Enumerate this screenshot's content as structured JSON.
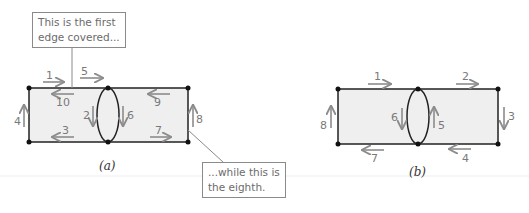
{
  "figure_a": {
    "caption": "(a)",
    "callout_top": {
      "line1": "This is the first",
      "line2": "edge covered..."
    },
    "callout_bottom": {
      "line1": "...while this is",
      "line2": "the eighth."
    },
    "edge_labels": {
      "e1": "1",
      "e2": "2",
      "e3": "3",
      "e4": "4",
      "e5": "5",
      "e6": "6",
      "e7": "7",
      "e8": "8",
      "e9": "9",
      "e10": "10"
    }
  },
  "figure_b": {
    "caption": "(b)",
    "edge_labels": {
      "e1": "1",
      "e2": "2",
      "e3": "3",
      "e4": "4",
      "e5": "5",
      "e6": "6",
      "e7": "7",
      "e8": "8"
    }
  },
  "colors": {
    "edge": "#222222",
    "arrow": "#8c8c8c",
    "fill": "#efefef",
    "label": "#7a7a7a"
  }
}
